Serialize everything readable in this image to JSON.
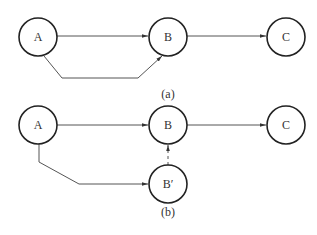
{
  "diagrams": [
    {
      "id": "a",
      "caption": "(a)",
      "nodes": [
        {
          "id": "A",
          "label": "A"
        },
        {
          "id": "B",
          "label": "B"
        },
        {
          "id": "C",
          "label": "C"
        }
      ],
      "edges": [
        {
          "from": "A",
          "to": "B",
          "style": "solid",
          "route": "straight"
        },
        {
          "from": "A",
          "to": "B",
          "style": "solid",
          "route": "bent-below"
        },
        {
          "from": "B",
          "to": "C",
          "style": "solid",
          "route": "straight"
        }
      ]
    },
    {
      "id": "b",
      "caption": "(b)",
      "nodes": [
        {
          "id": "A",
          "label": "A"
        },
        {
          "id": "B",
          "label": "B"
        },
        {
          "id": "C",
          "label": "C"
        },
        {
          "id": "B_prime",
          "label": "B′"
        }
      ],
      "edges": [
        {
          "from": "A",
          "to": "B",
          "style": "solid",
          "route": "straight"
        },
        {
          "from": "B",
          "to": "C",
          "style": "solid",
          "route": "straight"
        },
        {
          "from": "A",
          "to": "B′",
          "style": "solid",
          "route": "bent-below"
        },
        {
          "from": "B′",
          "to": "B",
          "style": "dashed",
          "route": "vertical"
        }
      ]
    }
  ]
}
